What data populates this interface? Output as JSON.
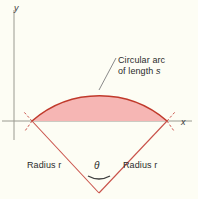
{
  "figure": {
    "background_color": "#fdfdf4",
    "axes": {
      "y_label": "y",
      "x_label": "x",
      "axis_color": "#9a9a90"
    },
    "annotations": {
      "arc_label_line1": "Circular arc",
      "arc_label_line2_prefix": "of length ",
      "arc_label_line2_symbol": "s",
      "radius_left": "Radius r",
      "radius_right": "Radius r",
      "angle_symbol": "θ"
    },
    "colors": {
      "arc_stroke": "#c0392b",
      "sector_fill": "#f6b6b4",
      "radius_stroke": "#c9524a",
      "leader_line": "#8a8a8a",
      "angle_arc": "#4a4a4a"
    },
    "geometry": {
      "vertex_x": 99,
      "vertex_y": 193,
      "arc_left_x": 32,
      "arc_left_y": 121,
      "arc_right_x": 167,
      "arc_right_y": 121,
      "arc_apex_x": 99,
      "arc_apex_y": 90,
      "x_axis_y": 121,
      "y_axis_x": 14
    }
  }
}
